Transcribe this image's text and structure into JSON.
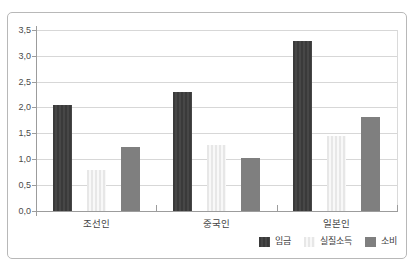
{
  "chart_data": {
    "type": "bar",
    "title": "",
    "xlabel": "",
    "ylabel": "",
    "categories": [
      "조선인",
      "중국인",
      "일본인"
    ],
    "series": [
      {
        "name": "임금",
        "color": "#3a3a3a",
        "stripe_color": "#474747",
        "values": [
          2.05,
          2.3,
          3.28
        ]
      },
      {
        "name": "실질소득",
        "color": "#e7e7e7",
        "stripe_color": "#f8f8f8",
        "values": [
          0.8,
          1.27,
          1.45
        ]
      },
      {
        "name": "소비",
        "color": "#7f7f7f",
        "stripe_color": null,
        "values": [
          1.24,
          1.03,
          1.82
        ]
      }
    ],
    "ylim": [
      0,
      3.5
    ],
    "ytick_step": 0.5,
    "ytick_labels": [
      "0,0",
      "0,5",
      "1,0",
      "1,5",
      "2,0",
      "2,5",
      "3,0",
      "3,5"
    ],
    "decimal_separator": ",",
    "grid": true,
    "legend_position": "bottom-right"
  },
  "colors": {
    "axis": "#9c9c9c",
    "gridline": "#d7d7d7",
    "frame_border": "#b8b8b8",
    "text": "#4a4a4a",
    "background": "#ffffff"
  }
}
